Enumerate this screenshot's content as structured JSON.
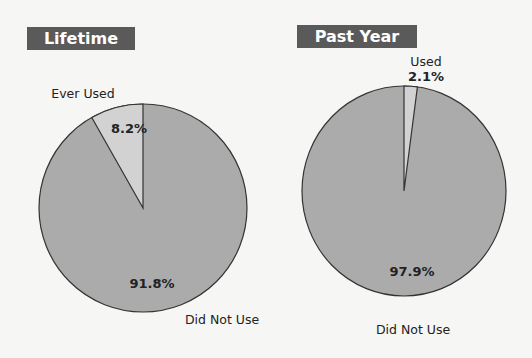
{
  "chart_data": [
    {
      "type": "pie",
      "title": "Lifetime",
      "categories": [
        "Ever Used",
        "Did Not Use"
      ],
      "values": [
        8.2,
        91.8
      ],
      "labels": [
        "8.2%",
        "91.8%"
      ],
      "colors": [
        "#d2d2d2",
        "#ababab"
      ],
      "start_angle": "12 o'clock, Ever Used slice counter-clockwise"
    },
    {
      "type": "pie",
      "title": "Past Year",
      "categories": [
        "Used",
        "Did Not Use"
      ],
      "values": [
        2.1,
        97.9
      ],
      "labels": [
        "2.1%",
        "97.9%"
      ],
      "colors": [
        "#d2d2d2",
        "#ababab"
      ],
      "start_angle": "12 o'clock, Used slice clockwise"
    }
  ],
  "charts": {
    "left": {
      "title": "Lifetime",
      "slice_label": "Ever Used",
      "slice_pct": "8.2%",
      "rest_label": "Did Not Use",
      "rest_pct": "91.8%"
    },
    "right": {
      "title": "Past Year",
      "slice_label": "Used",
      "slice_pct": "2.1%",
      "rest_label": "Did Not Use",
      "rest_pct": "97.9%"
    }
  },
  "colors": {
    "badge_bg": "#5a5a5a",
    "slice_light": "#d2d2d2",
    "slice_main": "#ababab",
    "outline": "#333333"
  }
}
